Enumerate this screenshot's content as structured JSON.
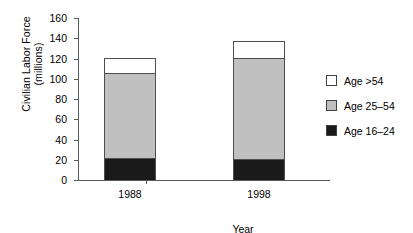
{
  "chart_data": {
    "type": "bar",
    "subtype": "stacked-bar",
    "title": "",
    "xlabel": "Year",
    "ylabel": "Civilian Labor Force (millions)",
    "ylabel_lines": [
      "Civilian Labor Force",
      "(millions)"
    ],
    "categories": [
      "1988",
      "1998"
    ],
    "series": [
      {
        "name": "Age 16–24",
        "values": [
          22,
          21
        ],
        "color": "#1a1a1a"
      },
      {
        "name": "Age 25–54",
        "values": [
          85,
          101
        ],
        "color": "#c0c0c0"
      },
      {
        "name": "Age >54",
        "values": [
          15,
          17
        ],
        "color": "#ffffff"
      }
    ],
    "totals": [
      122,
      139
    ],
    "cumulative_tops": [
      [
        22,
        107,
        122
      ],
      [
        21,
        122,
        139
      ]
    ],
    "ylim": [
      0,
      160
    ],
    "ytick_step": 20,
    "yticks": [
      "0",
      "20",
      "40",
      "60",
      "80",
      "100",
      "120",
      "140",
      "160"
    ],
    "grid": false,
    "legend_position": "right",
    "legend_order_top_to_bottom": [
      "Age >54",
      "Age 25–54",
      "Age 16–24"
    ],
    "axis_color": "#555a5e",
    "bar_edge_color": "#4a4f53"
  },
  "legend": {
    "items": [
      {
        "label": "Age >54",
        "color": "#ffffff"
      },
      {
        "label": "Age 25–54",
        "color": "#c0c0c0"
      },
      {
        "label": "Age 16–24",
        "color": "#1a1a1a"
      }
    ]
  },
  "axes": {
    "y_title_line1": "Civilian Labor Force",
    "y_title_line2": "(millions)",
    "x_title": "Year"
  }
}
